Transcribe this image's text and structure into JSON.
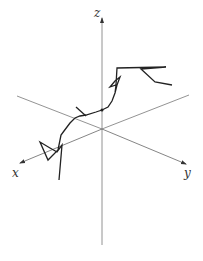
{
  "figure": {
    "axes": {
      "z": {
        "label": "z"
      },
      "x": {
        "label": "x"
      },
      "y": {
        "label": "y"
      }
    },
    "colors": {
      "axis": "#666666",
      "path": "#222222",
      "background": "#ffffff"
    }
  }
}
